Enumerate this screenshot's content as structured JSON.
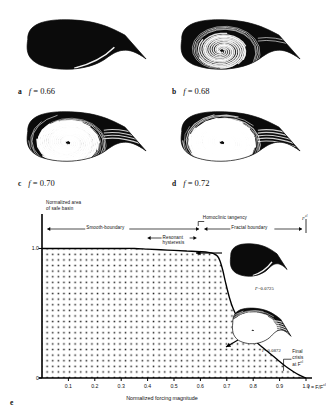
{
  "figure": {
    "panels": [
      {
        "id": "a",
        "letter": "a",
        "eq_var": "f",
        "eq_eq": "=",
        "eq_val": "0.66",
        "x": 18,
        "y": 14,
        "w": 130,
        "h": 64,
        "fractal": 0.02
      },
      {
        "id": "b",
        "letter": "b",
        "eq_var": "f",
        "eq_eq": "=",
        "eq_val": "0.68",
        "x": 172,
        "y": 14,
        "w": 130,
        "h": 64,
        "fractal": 0.38
      },
      {
        "id": "c",
        "letter": "c",
        "eq_var": "f",
        "eq_eq": "=",
        "eq_val": "0.70",
        "x": 18,
        "y": 106,
        "w": 130,
        "h": 64,
        "fractal": 0.8
      },
      {
        "id": "d",
        "letter": "d",
        "eq_var": "f",
        "eq_eq": "=",
        "eq_val": "0.72",
        "x": 172,
        "y": 106,
        "w": 130,
        "h": 64,
        "fractal": 0.95
      }
    ],
    "panel_e_letter": "e"
  },
  "chart_data": {
    "type": "line",
    "title": "",
    "xlabel": "Normalized forcing magnitude",
    "ylabel": "Normalized area of safe basin",
    "xlabel_end_note": "f = F/F",
    "xlabel_end_sup": "cl",
    "xlim": [
      0.0,
      1.0
    ],
    "ylim": [
      0.0,
      1.05
    ],
    "grid": false,
    "legend": null,
    "fill": "stipple-dots",
    "xticks": [
      "0.1",
      "0.2",
      "0.3",
      "0.4",
      "0.5",
      "0.6",
      "0.7",
      "0.8",
      "0.9",
      "1.0"
    ],
    "xtick_values": [
      0.1,
      0.2,
      0.3,
      0.4,
      0.5,
      0.6,
      0.7,
      0.8,
      0.9,
      1.0
    ],
    "yticks": [
      "1.0",
      "0"
    ],
    "ytick_values": [
      1.0,
      0.0
    ],
    "x": [
      0.0,
      0.05,
      0.1,
      0.15,
      0.2,
      0.25,
      0.3,
      0.35,
      0.4,
      0.45,
      0.5,
      0.55,
      0.6,
      0.63,
      0.65,
      0.665,
      0.675,
      0.685,
      0.695,
      0.71,
      0.725,
      0.745,
      0.77,
      0.8,
      0.83,
      0.86,
      0.89,
      0.92,
      0.95,
      0.975,
      1.0
    ],
    "y": [
      1.0,
      1.0,
      1.0,
      1.0,
      1.0,
      1.0,
      1.0,
      1.0,
      0.995,
      0.99,
      0.985,
      0.98,
      0.975,
      0.97,
      0.96,
      0.94,
      0.9,
      0.83,
      0.74,
      0.62,
      0.53,
      0.45,
      0.375,
      0.3,
      0.245,
      0.195,
      0.145,
      0.095,
      0.052,
      0.022,
      0.0
    ],
    "series_name": "normalized safe basin area",
    "annotations": [
      {
        "id": "smooth-boundary",
        "text": "Smooth-boundary",
        "type": "span-label",
        "x_start": 0.02,
        "x_end": 0.595
      },
      {
        "id": "fractal-boundary",
        "text": "Fractal boundary",
        "type": "span-label",
        "x_start": 0.615,
        "x_end": 0.985
      },
      {
        "id": "homoclinic-tangency",
        "text": "Homoclinic tangency",
        "type": "point-label",
        "x": 0.605
      },
      {
        "id": "resonant-hysteresis",
        "text_line1": "Resonant",
        "text_line2": "hysteresis",
        "type": "span-label",
        "x_start": 0.4,
        "x_end": 0.585
      },
      {
        "id": "final-crisis",
        "text_line1": "Final",
        "text_line2": "crisis",
        "text_line3": "at F",
        "sup": "cl",
        "type": "point-label",
        "x": 0.975
      },
      {
        "id": "fcl-marker",
        "text": "F",
        "sup": "cl",
        "type": "axis-marker",
        "x": 1.0
      }
    ],
    "inset_images": [
      {
        "id": "inset-smooth",
        "caption_var": "F",
        "caption_eq": "=",
        "caption_val": "0.0725",
        "fractal": 0.02
      },
      {
        "id": "inset-fractal",
        "caption_var": "F",
        "caption_eq": "=",
        "caption_val": "0.0872",
        "fractal": 0.95
      }
    ]
  }
}
